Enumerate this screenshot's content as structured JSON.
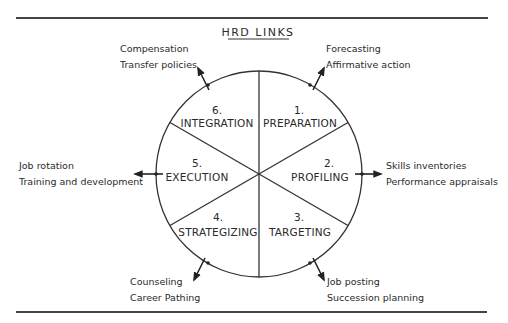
{
  "title": "HRD LINKS",
  "segments": [
    {
      "number": "1.",
      "name": "PREPARATION"
    },
    {
      "number": "2.",
      "name": "PROFILING"
    },
    {
      "number": "3.",
      "name": "TARGETING"
    },
    {
      "number": "4.",
      "name": "STRATEGIZING"
    },
    {
      "number": "5.",
      "name": "EXECUTION"
    },
    {
      "number": "6.",
      "name": "INTEGRATION"
    }
  ],
  "links": [
    {
      "segment": "1.",
      "items": [
        "Forecasting",
        "Affirmative action"
      ]
    },
    {
      "segment": "2.",
      "items": [
        "Skills inventories",
        "Performance appraisals"
      ]
    },
    {
      "segment": "3.",
      "items": [
        "Job posting",
        "Succession planning"
      ]
    },
    {
      "segment": "4.",
      "items": [
        "Counseling",
        "Career Pathing"
      ]
    },
    {
      "segment": "5.",
      "items": [
        "Job rotation",
        "Training and development"
      ]
    },
    {
      "segment": "6.",
      "items": [
        "Compensation",
        "Transfer policies"
      ]
    }
  ]
}
